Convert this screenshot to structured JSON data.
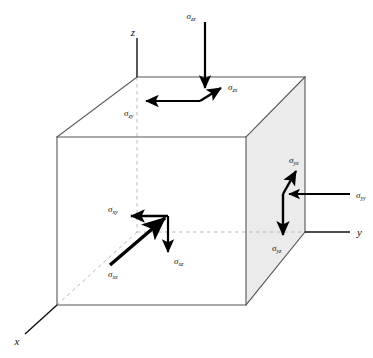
{
  "figure": {
    "type": "stress-tensor-cube-diagram",
    "background_color": "#ffffff",
    "cube_face_color": "#ebebeb",
    "edge_color": "#555555",
    "hidden_edge_color": "#b0b0b0",
    "arrow_color": "#000000"
  },
  "axes": [
    {
      "name": "z",
      "label": "z",
      "direction": "up"
    },
    {
      "name": "y",
      "label": "y",
      "direction": "right"
    },
    {
      "name": "x",
      "label": "x",
      "direction": "down-left"
    }
  ],
  "stress_components": [
    {
      "name": "sigma-zz",
      "sigma": "σ",
      "sub": "zz",
      "face": "top",
      "direction": "down",
      "type": "normal"
    },
    {
      "name": "sigma-zx",
      "sigma": "σ",
      "sub": "zx",
      "face": "top",
      "direction": "up-right",
      "type": "shear"
    },
    {
      "name": "sigma-zy",
      "sigma": "σ",
      "sub": "zy",
      "face": "top",
      "direction": "left",
      "type": "shear"
    },
    {
      "name": "sigma-xx",
      "sigma": "σ",
      "sub": "xx",
      "face": "front",
      "direction": "up-right",
      "type": "normal"
    },
    {
      "name": "sigma-xy",
      "sigma": "σ",
      "sub": "xy",
      "face": "front",
      "direction": "left",
      "type": "shear"
    },
    {
      "name": "sigma-xz",
      "sigma": "σ",
      "sub": "xz",
      "face": "front",
      "direction": "down",
      "type": "shear"
    },
    {
      "name": "sigma-yy",
      "sigma": "σ",
      "sub": "yy",
      "face": "right",
      "direction": "left",
      "type": "normal"
    },
    {
      "name": "sigma-yx",
      "sigma": "σ",
      "sub": "yx",
      "face": "right",
      "direction": "up-right",
      "type": "shear"
    },
    {
      "name": "sigma-yz",
      "sigma": "σ",
      "sub": "yz",
      "face": "right",
      "direction": "down",
      "type": "shear"
    }
  ]
}
